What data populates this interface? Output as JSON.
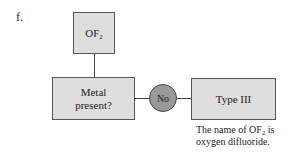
{
  "diagram": {
    "item_label": "f.",
    "start_node": {
      "formula_base": "OF",
      "formula_sub": "2"
    },
    "decision_node": {
      "line1": "Metal",
      "line2": "present?"
    },
    "branch": {
      "label": "No"
    },
    "result_node": {
      "label": "Type III"
    },
    "caption": {
      "line1_prefix": "The name of OF",
      "line1_sub": "2",
      "line1_suffix": " is",
      "line2": "oxygen difluoride."
    },
    "colors": {
      "box_fill": "#dedede",
      "circle_fill": "#9a9a9a",
      "stroke": "#444444"
    }
  }
}
